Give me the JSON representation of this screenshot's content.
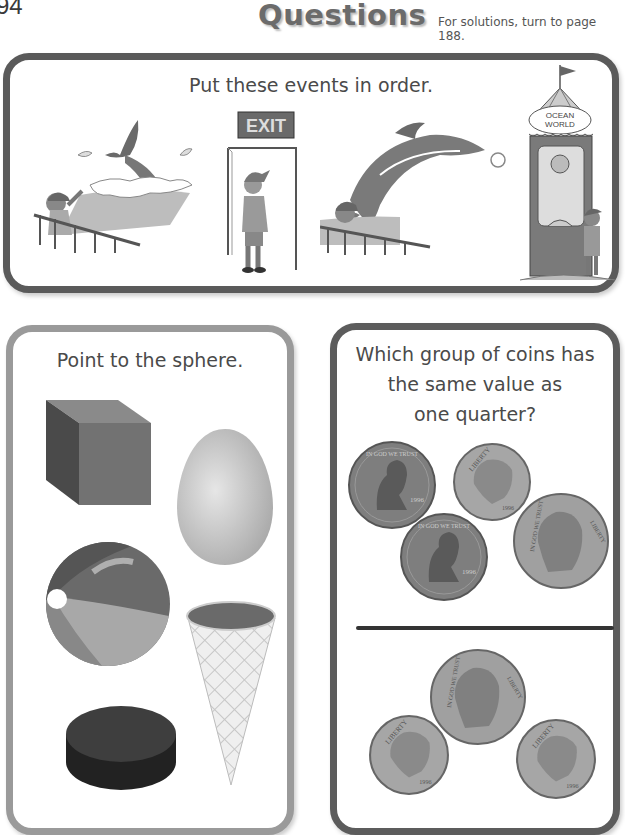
{
  "header": {
    "page_number": "94",
    "title": "Questions",
    "subtitle": "For solutions, turn to page 188."
  },
  "sequence_panel": {
    "heading": "Put these events in order.",
    "scenes": [
      {
        "name": "whale-splash",
        "description": "Boy at railing watching whale dive into splashing water"
      },
      {
        "name": "exit-door",
        "description": "Boy in cap standing at doorway under EXIT sign",
        "sign_text": "EXIT"
      },
      {
        "name": "dolphin-jump",
        "description": "Boy at railing watching dolphin leap toward ball"
      },
      {
        "name": "ticket-booth",
        "description": "Boy buying ticket at Ocean World booth",
        "sign_text": "OCEAN WORLD"
      }
    ]
  },
  "sphere_panel": {
    "heading": "Point to the sphere.",
    "shapes": [
      {
        "name": "cube"
      },
      {
        "name": "egg"
      },
      {
        "name": "beach-ball"
      },
      {
        "name": "cone"
      },
      {
        "name": "hockey-puck"
      }
    ]
  },
  "coins_panel": {
    "heading_lines": [
      "Which group of coins has",
      "the same value as",
      "one quarter?"
    ],
    "group_a": {
      "coins": [
        {
          "type": "penny",
          "legend": "IN GOD WE TRUST",
          "side": "LIBERTY",
          "year": "1996"
        },
        {
          "type": "dime",
          "legend": "LIBERTY",
          "year": "1996"
        },
        {
          "type": "penny",
          "legend": "IN GOD WE TRUST",
          "side": "LIBERTY",
          "year": "1996"
        },
        {
          "type": "nickel",
          "legend": "IN GOD WE TRUST",
          "side": "LIBERTY",
          "year": "1996"
        }
      ]
    },
    "group_b": {
      "coins": [
        {
          "type": "nickel",
          "legend": "IN GOD WE TRUST",
          "side": "LIBERTY",
          "year": "1996"
        },
        {
          "type": "dime",
          "legend": "LIBERTY",
          "year": "1996"
        },
        {
          "type": "dime",
          "legend": "LIBERTY",
          "year": "1996"
        }
      ]
    }
  }
}
